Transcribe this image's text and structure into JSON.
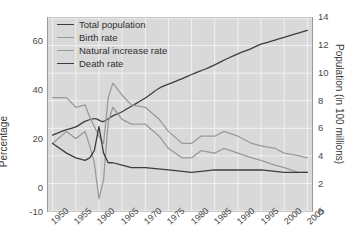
{
  "chart_data": {
    "type": "line",
    "title": "",
    "xlabel": "",
    "ylabel": "Percentage",
    "y2label": "Population (in 100 millions)",
    "grid": true,
    "legend_position": "top-left",
    "xlim": [
      1949,
      2006
    ],
    "ylim": [
      -10,
      70
    ],
    "y2lim": [
      0,
      14
    ],
    "yticks": [
      -10,
      0,
      20,
      40,
      60
    ],
    "ytick_labels": [
      "-10",
      "0",
      "20",
      "40",
      "60"
    ],
    "y2ticks": [
      0,
      2,
      4,
      6,
      8,
      10,
      12,
      14
    ],
    "y2tick_labels": [
      "0",
      "2",
      "4",
      "6",
      "8",
      "10",
      "12",
      "14"
    ],
    "xticks": [
      1950,
      1955,
      1960,
      1965,
      1970,
      1975,
      1980,
      1985,
      1990,
      1995,
      2000,
      2005
    ],
    "xtick_labels": [
      "1950",
      "1955",
      "1960",
      "1965",
      "1970",
      "1975",
      "1980",
      "1985",
      "1990",
      "1995",
      "2000",
      "2005"
    ],
    "series": [
      {
        "name": "Total population",
        "axis": "right",
        "color": "#3d3d3d",
        "x": [
          1950,
          1953,
          1955,
          1957,
          1959,
          1960,
          1961,
          1963,
          1965,
          1967,
          1970,
          1973,
          1975,
          1978,
          1980,
          1983,
          1985,
          1988,
          1990,
          1993,
          1995,
          1998,
          2000,
          2003,
          2005
        ],
        "values": [
          5.5,
          5.9,
          6.1,
          6.5,
          6.7,
          6.6,
          6.5,
          6.9,
          7.2,
          7.6,
          8.2,
          8.9,
          9.2,
          9.6,
          9.9,
          10.3,
          10.6,
          11.1,
          11.4,
          11.8,
          12.1,
          12.4,
          12.6,
          12.9,
          13.1
        ]
      },
      {
        "name": "Birth rate",
        "axis": "left",
        "color": "#9a9a9a",
        "x": [
          1950,
          1953,
          1955,
          1957,
          1958,
          1959,
          1960,
          1961,
          1962,
          1963,
          1965,
          1967,
          1970,
          1973,
          1975,
          1978,
          1980,
          1982,
          1985,
          1987,
          1990,
          1993,
          1995,
          1998,
          2000,
          2003,
          2005
        ],
        "values": [
          37,
          37,
          33,
          34,
          29,
          25,
          21,
          18,
          37,
          43,
          38,
          34,
          33,
          28,
          23,
          18,
          18,
          21,
          21,
          23,
          21,
          18,
          17,
          16,
          14,
          13,
          12
        ]
      },
      {
        "name": "Natural increase rate",
        "axis": "left",
        "color": "#9a9a9a",
        "x": [
          1950,
          1953,
          1955,
          1957,
          1958,
          1959,
          1960,
          1961,
          1962,
          1963,
          1965,
          1967,
          1970,
          1973,
          1975,
          1978,
          1980,
          1982,
          1985,
          1987,
          1990,
          1993,
          1995,
          1998,
          2000,
          2003,
          2005
        ],
        "values": [
          18,
          23,
          20,
          23,
          17,
          10,
          -5,
          3,
          27,
          33,
          28,
          26,
          26,
          21,
          16,
          12,
          12,
          15,
          14,
          16,
          14,
          12,
          11,
          9,
          8,
          6,
          6
        ]
      },
      {
        "name": "Death rate",
        "axis": "left",
        "color": "#3d3d3d",
        "x": [
          1950,
          1953,
          1955,
          1957,
          1958,
          1959,
          1960,
          1961,
          1962,
          1963,
          1965,
          1967,
          1970,
          1975,
          1980,
          1985,
          1990,
          1995,
          2000,
          2005
        ],
        "values": [
          18,
          14,
          12,
          11,
          12,
          15,
          25,
          14,
          10,
          10,
          9,
          8,
          8,
          7,
          6,
          7,
          7,
          7,
          6,
          6
        ]
      }
    ]
  },
  "legend": {
    "items": [
      {
        "label": "Total population",
        "color": "#3d3d3d"
      },
      {
        "label": "Birth rate",
        "color": "#9a9a9a"
      },
      {
        "label": "Natural increase rate",
        "color": "#9a9a9a"
      },
      {
        "label": "Death rate",
        "color": "#3d3d3d"
      }
    ]
  }
}
